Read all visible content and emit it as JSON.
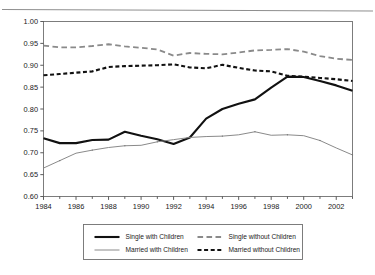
{
  "chart_data": {
    "type": "line",
    "title": "",
    "xlabel": "",
    "ylabel": "",
    "xlim": [
      1984,
      2003
    ],
    "ylim": [
      0.6,
      1.0
    ],
    "grid": false,
    "legend_position": "bottom",
    "x": [
      1984,
      1985,
      1986,
      1987,
      1988,
      1989,
      1990,
      1991,
      1992,
      1993,
      1994,
      1995,
      1996,
      1997,
      1998,
      1999,
      2000,
      2001,
      2002,
      2003
    ],
    "yticks": [
      "0.60",
      "0.65",
      "0.70",
      "0.75",
      "0.80",
      "0.85",
      "0.90",
      "0.95",
      "1.00"
    ],
    "ytick_values": [
      0.6,
      0.65,
      0.7,
      0.75,
      0.8,
      0.85,
      0.9,
      0.95,
      1.0
    ],
    "xticks": [
      "1984",
      "1986",
      "1988",
      "1990",
      "1992",
      "1994",
      "1996",
      "1998",
      "2000",
      "2002"
    ],
    "xtick_values": [
      1984,
      1986,
      1988,
      1990,
      1992,
      1994,
      1996,
      1998,
      2000,
      2002
    ],
    "series": [
      {
        "name": "Single with Children",
        "style": "solid",
        "color": "#111111",
        "width": 2.1,
        "values": [
          0.733,
          0.722,
          0.722,
          0.729,
          0.73,
          0.748,
          0.739,
          0.731,
          0.72,
          0.735,
          0.778,
          0.8,
          0.812,
          0.822,
          0.849,
          0.874,
          0.873,
          0.864,
          0.854,
          0.842
        ]
      },
      {
        "name": "Single without Children",
        "style": "longdash",
        "color": "#8a8a8a",
        "width": 1.8,
        "values": [
          0.945,
          0.941,
          0.941,
          0.944,
          0.948,
          0.943,
          0.94,
          0.936,
          0.922,
          0.928,
          0.926,
          0.925,
          0.929,
          0.934,
          0.935,
          0.937,
          0.931,
          0.921,
          0.915,
          0.912
        ]
      },
      {
        "name": "Married with Children",
        "style": "solid",
        "color": "#8a8a8a",
        "width": 1.0,
        "values": [
          0.665,
          0.682,
          0.699,
          0.706,
          0.712,
          0.716,
          0.717,
          0.725,
          0.73,
          0.735,
          0.737,
          0.738,
          0.741,
          0.748,
          0.74,
          0.741,
          0.739,
          0.728,
          0.711,
          0.695
        ]
      },
      {
        "name": "Married without Children",
        "style": "dash",
        "color": "#111111",
        "width": 2.1,
        "values": [
          0.877,
          0.88,
          0.883,
          0.886,
          0.896,
          0.898,
          0.899,
          0.9,
          0.902,
          0.895,
          0.893,
          0.901,
          0.894,
          0.888,
          0.886,
          0.876,
          0.874,
          0.871,
          0.868,
          0.864
        ]
      }
    ]
  },
  "legend": {
    "items": [
      {
        "label": "Single with Children"
      },
      {
        "label": "Single without Children"
      },
      {
        "label": "Married with Children"
      },
      {
        "label": "Married without Children"
      }
    ]
  }
}
